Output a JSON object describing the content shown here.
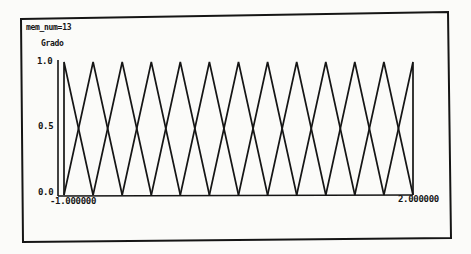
{
  "window": {
    "header_label": "mem_num=13"
  },
  "chart_data": {
    "type": "line",
    "title": "mem_num=13",
    "ylabel": "Grado",
    "xlabel": "",
    "xlim": [
      -1.0,
      2.0
    ],
    "ylim": [
      0.0,
      1.0
    ],
    "x_tick_labels": [
      "-1.000000",
      "2.000000"
    ],
    "y_tick_labels": [
      "0.0",
      "0.5",
      "1.0"
    ],
    "grid": false,
    "legend": null,
    "membership_function_count": 13,
    "membership_function_shape": "triangular",
    "centers": [
      -1.0,
      -0.75,
      -0.5,
      -0.25,
      0.0,
      0.25,
      0.5,
      0.75,
      1.0,
      1.25,
      1.5,
      1.75,
      2.0
    ],
    "half_width": 0.25,
    "crossing_degree": 0.5,
    "series": [
      {
        "name": "MF1",
        "x": [
          -1.0,
          -1.0,
          -0.75
        ],
        "y": [
          0,
          1,
          0
        ]
      },
      {
        "name": "MF2",
        "x": [
          -1.0,
          -0.75,
          -0.5
        ],
        "y": [
          0,
          1,
          0
        ]
      },
      {
        "name": "MF3",
        "x": [
          -0.75,
          -0.5,
          -0.25
        ],
        "y": [
          0,
          1,
          0
        ]
      },
      {
        "name": "MF4",
        "x": [
          -0.5,
          -0.25,
          0.0
        ],
        "y": [
          0,
          1,
          0
        ]
      },
      {
        "name": "MF5",
        "x": [
          -0.25,
          0.0,
          0.25
        ],
        "y": [
          0,
          1,
          0
        ]
      },
      {
        "name": "MF6",
        "x": [
          0.0,
          0.25,
          0.5
        ],
        "y": [
          0,
          1,
          0
        ]
      },
      {
        "name": "MF7",
        "x": [
          0.25,
          0.5,
          0.75
        ],
        "y": [
          0,
          1,
          0
        ]
      },
      {
        "name": "MF8",
        "x": [
          0.5,
          0.75,
          1.0
        ],
        "y": [
          0,
          1,
          0
        ]
      },
      {
        "name": "MF9",
        "x": [
          0.75,
          1.0,
          1.25
        ],
        "y": [
          0,
          1,
          0
        ]
      },
      {
        "name": "MF10",
        "x": [
          1.0,
          1.25,
          1.5
        ],
        "y": [
          0,
          1,
          0
        ]
      },
      {
        "name": "MF11",
        "x": [
          1.25,
          1.5,
          1.75
        ],
        "y": [
          0,
          1,
          0
        ]
      },
      {
        "name": "MF12",
        "x": [
          1.5,
          1.75,
          2.0
        ],
        "y": [
          0,
          1,
          0
        ]
      },
      {
        "name": "MF13",
        "x": [
          1.75,
          2.0,
          2.0
        ],
        "y": [
          0,
          1,
          0
        ]
      }
    ]
  },
  "colors": {
    "background": "#fbfbf9",
    "ink": "#151515"
  }
}
